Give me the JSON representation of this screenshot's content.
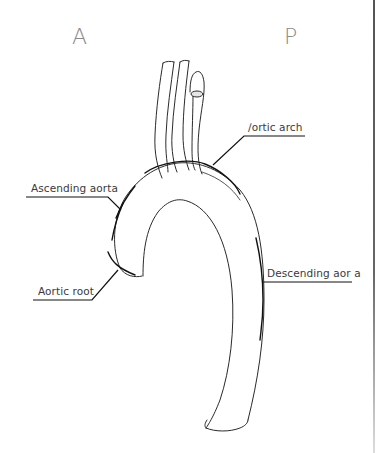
{
  "orientation": {
    "anterior": "A",
    "posterior": "P"
  },
  "labels": {
    "aortic_arch": "∕ortic arch",
    "ascending_aorta": "Ascending aorta",
    "aortic_root": "Aortic root",
    "descending_aorta": "Descending aor a"
  },
  "colors": {
    "line": "#1a1a1a",
    "text": "#3a3a3a",
    "orientation_text": "#8a8a8a",
    "background": "#ffffff"
  }
}
